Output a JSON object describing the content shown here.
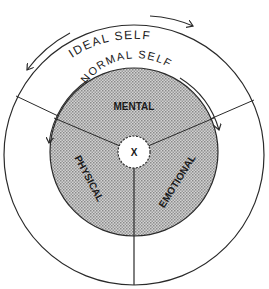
{
  "diagram": {
    "outer_label": "IDEAL SELF",
    "inner_label": "NORMAL SELF",
    "sectors": [
      {
        "label": "MENTAL"
      },
      {
        "label": "PHYSICAL"
      },
      {
        "label": "EMOTIONAL"
      }
    ],
    "center_label": "X",
    "colors": {
      "line": "#2a2a2a",
      "shade": "#b8b8b8",
      "background": "#ffffff"
    }
  }
}
